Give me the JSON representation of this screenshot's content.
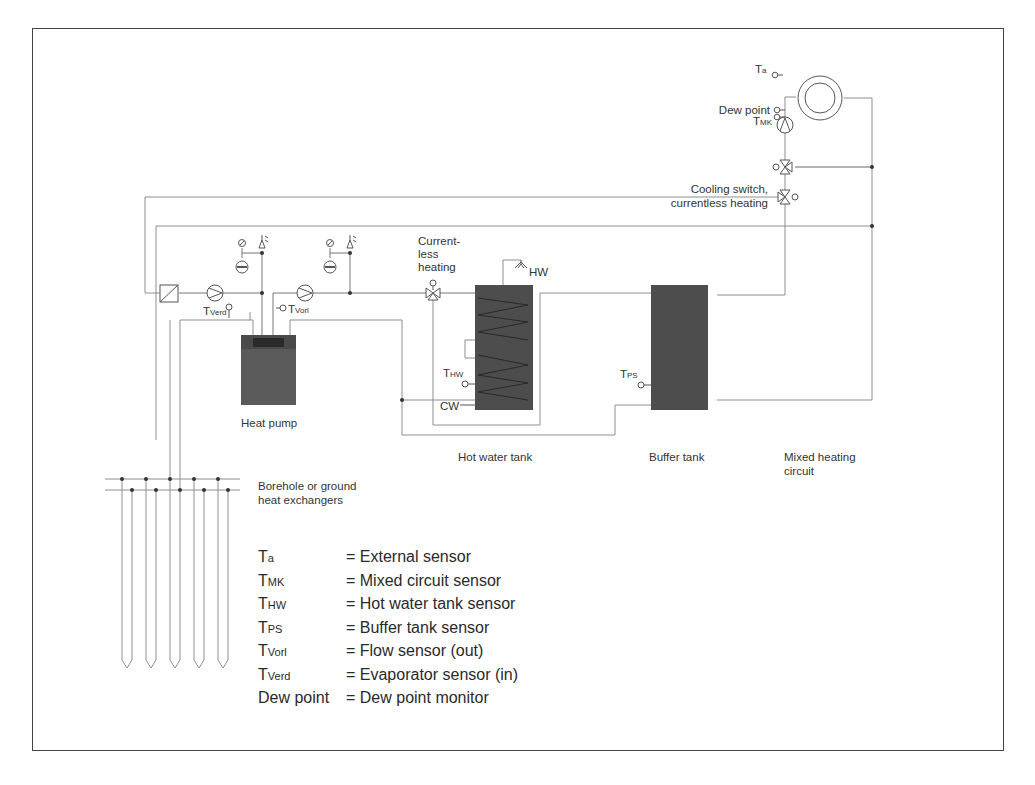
{
  "diagram": {
    "type": "hydraulic schematic",
    "components": {
      "heat_pump": "Heat pump",
      "hot_water_tank": "Hot water tank",
      "buffer_tank": "Buffer tank",
      "mixed_heating_circuit_line1": "Mixed heating",
      "mixed_heating_circuit_line2": "circuit",
      "borehole_line1": "Borehole or ground",
      "borehole_line2": "heat exchangers"
    },
    "labels": {
      "ta_main": "T",
      "ta_sub": "a",
      "dew_point": "Dew point",
      "tmk_main": "T",
      "tmk_sub": "MK",
      "cooling_line1": "Cooling switch,",
      "cooling_line2": "currentless heating",
      "currentless_line1": "Current-",
      "currentless_line2": "less",
      "currentless_line3": "heating",
      "hw": "HW",
      "cw": "CW",
      "thw_main": "T",
      "thw_sub": "HW",
      "tps_main": "T",
      "tps_sub": "PS",
      "tverd_main": "T",
      "tverd_sub": "Verd",
      "tvorl_main": "T",
      "tvorl_sub": "Vorl"
    },
    "legend": [
      {
        "symbol_main": "T",
        "symbol_sub": "a",
        "definition": "= External sensor"
      },
      {
        "symbol_main": "T",
        "symbol_sub": "MK",
        "definition": "= Mixed circuit sensor"
      },
      {
        "symbol_main": "T",
        "symbol_sub": "HW",
        "definition": "= Hot water tank sensor"
      },
      {
        "symbol_main": "T",
        "symbol_sub": "PS",
        "definition": "= Buffer tank sensor"
      },
      {
        "symbol_main": "T",
        "symbol_sub": "Vorl",
        "definition": "= Flow sensor (out)"
      },
      {
        "symbol_main": "T",
        "symbol_sub": "Verd",
        "definition": "= Evaporator sensor (in)"
      },
      {
        "symbol_main": "Dew point",
        "symbol_sub": "",
        "definition": "= Dew point monitor"
      }
    ],
    "colors": {
      "tank_fill": "#4a4a4a",
      "pipe": "#8a8a8a",
      "pipe_dark": "#555555",
      "frame": "#444444"
    }
  }
}
